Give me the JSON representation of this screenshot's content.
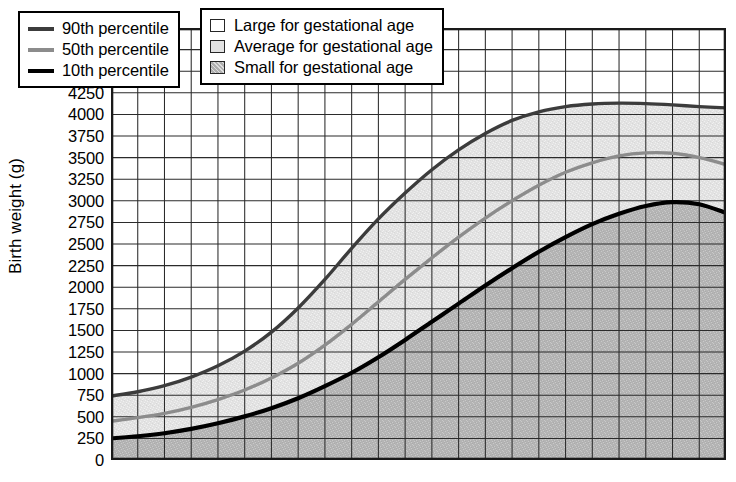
{
  "chart_data": {
    "type": "line",
    "title": "",
    "xlabel": "",
    "ylabel": "Birth weight (g)",
    "ylim": [
      0,
      5000
    ],
    "ytick_step": 250,
    "yticks": [
      5000,
      4750,
      4500,
      4250,
      4000,
      3750,
      3500,
      3250,
      3000,
      2750,
      2500,
      2250,
      2000,
      1750,
      1500,
      1250,
      1000,
      750,
      500,
      250,
      0
    ],
    "xlim": [
      0,
      23
    ],
    "x_grid_divisions": 23,
    "x_tick_labels": [],
    "grid": true,
    "legend_position": "top-left",
    "fill_bands": [
      {
        "name": "Large for gestational age",
        "region": "above 90th percentile",
        "color": "#ffffff"
      },
      {
        "name": "Average for gestational age",
        "region": "between 10th and 90th percentile",
        "color": "#e2e2e2"
      },
      {
        "name": "Small for gestational age",
        "region": "below 10th percentile",
        "color": "#b4b4b4"
      }
    ],
    "x": [
      0,
      1,
      2,
      3,
      4,
      5,
      6,
      7,
      8,
      9,
      10,
      11,
      12,
      13,
      14,
      15,
      16,
      17,
      18,
      19,
      20,
      21,
      22,
      23
    ],
    "series": [
      {
        "name": "90th percentile",
        "color": "#3c3c3c",
        "width": 3.4,
        "values": [
          740,
          790,
          860,
          960,
          1090,
          1260,
          1480,
          1760,
          2090,
          2450,
          2790,
          3090,
          3360,
          3590,
          3780,
          3930,
          4030,
          4090,
          4120,
          4130,
          4125,
          4110,
          4090,
          4075
        ]
      },
      {
        "name": "50th percentile",
        "color": "#8c8c8c",
        "width": 3.4,
        "values": [
          450,
          490,
          540,
          610,
          700,
          810,
          950,
          1120,
          1330,
          1570,
          1830,
          2090,
          2340,
          2580,
          2800,
          3000,
          3180,
          3330,
          3440,
          3520,
          3555,
          3550,
          3500,
          3420
        ]
      },
      {
        "name": "10th percentile",
        "color": "#000000",
        "width": 4.2,
        "values": [
          250,
          275,
          310,
          360,
          425,
          505,
          600,
          715,
          855,
          1010,
          1190,
          1390,
          1600,
          1810,
          2020,
          2220,
          2410,
          2580,
          2730,
          2850,
          2940,
          2985,
          2960,
          2860
        ]
      }
    ]
  },
  "axis": {
    "y_title": "Birth weight (g)",
    "y_labels": [
      "5000",
      "4750",
      "4500",
      "4250",
      "4000",
      "3750",
      "3500",
      "3250",
      "3000",
      "2750",
      "2500",
      "2250",
      "2000",
      "1750",
      "1500",
      "1250",
      "1000",
      "750",
      "500",
      "250",
      "0"
    ]
  },
  "legend_lines": {
    "items": [
      {
        "label": "90th percentile",
        "color": "#3c3c3c"
      },
      {
        "label": "50th percentile",
        "color": "#8c8c8c"
      },
      {
        "label": "10th percentile",
        "color": "#000000"
      }
    ]
  },
  "legend_fills": {
    "items": [
      {
        "label": "Large for gestational age",
        "fill": "#ffffff"
      },
      {
        "label": "Average for gestational age",
        "fill": "#e2e2e2"
      },
      {
        "label": "Small for gestational age",
        "fill": "#b0b0b0"
      }
    ]
  }
}
